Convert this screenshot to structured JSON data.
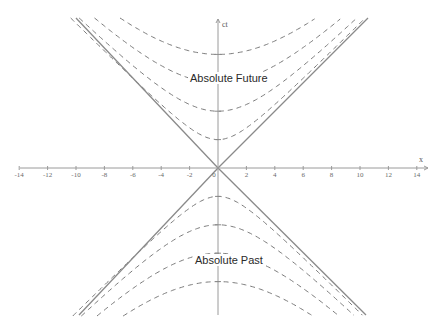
{
  "diagram": {
    "regions": {
      "future_label": "Absolute Future",
      "past_label": "Absolute Past"
    },
    "axes": {
      "x_label": "x",
      "y_label": "ct",
      "x_ticks": [
        "-14",
        "-12",
        "-10",
        "-8",
        "-6",
        "-4",
        "-2",
        "0",
        "2",
        "4",
        "6",
        "8",
        "10",
        "12",
        "14"
      ],
      "x_range": [
        -14,
        14
      ]
    },
    "light_cone": {
      "lines": [
        "ct = x",
        "ct = -x"
      ],
      "style": "solid",
      "color": "#7a7a7a"
    },
    "hyperbolas": {
      "style": "dashed",
      "color": "#7a7a7a",
      "future_vertices_ct": [
        2,
        4,
        6,
        8
      ],
      "past_vertices_ct": [
        -2,
        -4,
        -6,
        -8
      ]
    },
    "colors": {
      "axis": "#8a8a8a",
      "text": "#2a2a2a",
      "background": "#ffffff"
    }
  }
}
